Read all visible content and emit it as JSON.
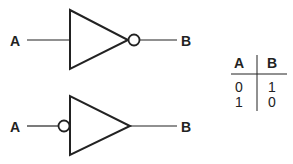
{
  "diagram": {
    "gates": [
      {
        "type": "inverter-output-bubble",
        "input_label": "A",
        "output_label": "B"
      },
      {
        "type": "inverter-input-bubble",
        "input_label": "A",
        "output_label": "B"
      }
    ],
    "truth_table": {
      "headers": [
        "A",
        "B"
      ],
      "rows": [
        [
          "0",
          "1"
        ],
        [
          "1",
          "0"
        ]
      ]
    },
    "colors": {
      "stroke": "#222222",
      "background": "#ffffff"
    }
  }
}
